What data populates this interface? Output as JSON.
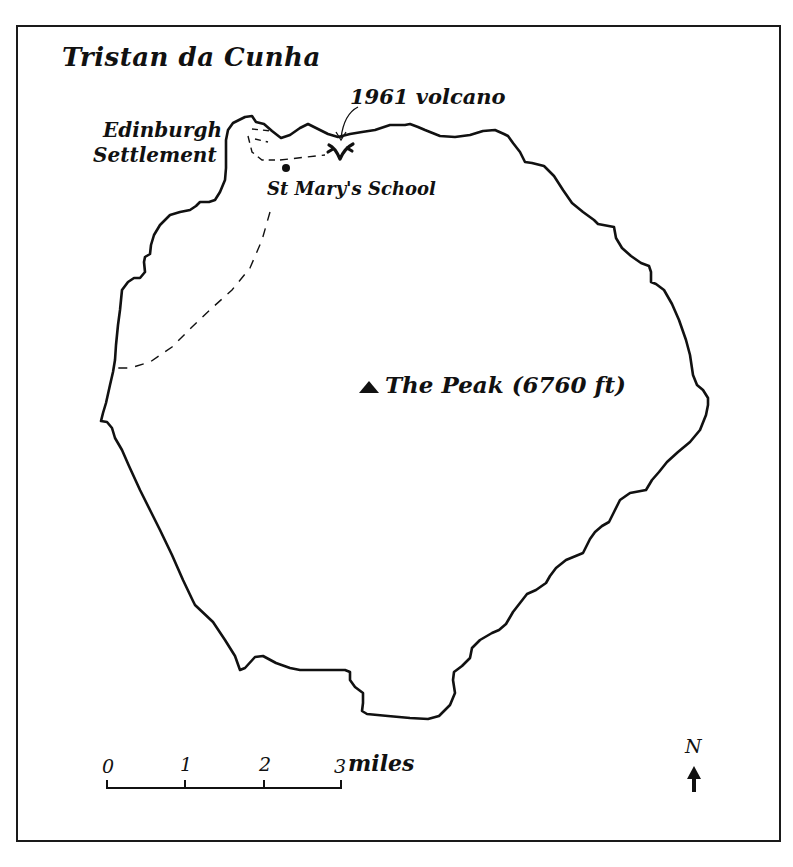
{
  "map": {
    "title": "Tristan da Cunha",
    "labels": {
      "volcano": "1961 volcano",
      "settlement_line1": "Edinburgh",
      "settlement_line2": "Settlement",
      "school": "St Mary's School",
      "peak": "The Peak (6760 ft)"
    },
    "scale_bar": {
      "ticks": [
        "0",
        "1",
        "2",
        "3"
      ],
      "unit": "miles"
    },
    "north_arrow": {
      "label": "N"
    },
    "colors": {
      "ink": "#111111",
      "background": "#ffffff"
    }
  }
}
